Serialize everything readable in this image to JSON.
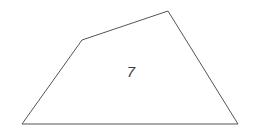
{
  "figure": {
    "background_color": "#ffffff",
    "stroke_color": "#555555",
    "stroke_width": 1,
    "label_color": "#3a3a3a",
    "shape": {
      "name": "quadrilateral",
      "closed": true,
      "vertices": [
        {
          "name": "bottom-left",
          "x": 22,
          "y": 124
        },
        {
          "name": "upper-left-bend",
          "x": 82,
          "y": 40
        },
        {
          "name": "top-apex",
          "x": 168,
          "y": 11
        },
        {
          "name": "bottom-right",
          "x": 238,
          "y": 124
        }
      ],
      "points_attr": "22,124 82,40 168,11 238,124"
    },
    "label": {
      "text": "7",
      "x": 131,
      "y": 73
    }
  }
}
